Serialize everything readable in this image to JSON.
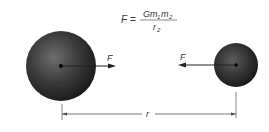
{
  "formula": {
    "lhs": "F",
    "equals": "=",
    "numerator_G": "Gm",
    "numerator_sub1": "1",
    "numerator_m": "m",
    "numerator_sub2": "2",
    "denominator": "r",
    "denominator_sub": "2"
  },
  "mass1": {
    "label": "m",
    "sub": "1",
    "force_label": "F"
  },
  "mass2": {
    "label": "m",
    "sub": "2",
    "force_label": "F"
  },
  "distance": {
    "label": "r"
  },
  "colors": {
    "sphere_dark": "#1a1a1a",
    "sphere_light": "#6e6e6e",
    "line": "#444444"
  }
}
